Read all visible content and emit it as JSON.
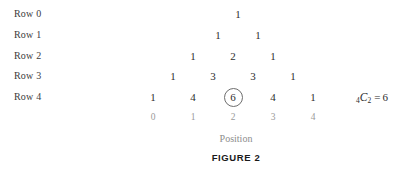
{
  "figure": {
    "caption": "FIGURE 2",
    "axis_title": "Position",
    "highlight_note": "circled value at row 4 position 2"
  },
  "row_labels": [
    {
      "label": "Row 0"
    },
    {
      "label": "Row 1"
    },
    {
      "label": "Row 2"
    },
    {
      "label": "Row 3"
    },
    {
      "label": "Row 4"
    }
  ],
  "triangle": {
    "rows": [
      {
        "row": 0,
        "values": [
          "1"
        ]
      },
      {
        "row": 1,
        "values": [
          "1",
          "1"
        ]
      },
      {
        "row": 2,
        "values": [
          "1",
          "2",
          "1"
        ]
      },
      {
        "row": 3,
        "values": [
          "1",
          "3",
          "3",
          "1"
        ]
      },
      {
        "row": 4,
        "values": [
          "1",
          "4",
          "6",
          "4",
          "1"
        ]
      }
    ]
  },
  "positions": [
    "0",
    "1",
    "2",
    "3",
    "4"
  ],
  "formula": {
    "pre_subscript": "4",
    "symbol": "C",
    "post_subscript": "2",
    "equals": "=",
    "result": "6"
  },
  "colors": {
    "background": "#ffffff",
    "number": "#2e2e2e",
    "row_label": "#3b3b3b",
    "position": "#9a9a9a",
    "axis_title": "#8d8d8d",
    "caption": "#1a1a1a",
    "circle_stroke": "#6e6e6e"
  }
}
